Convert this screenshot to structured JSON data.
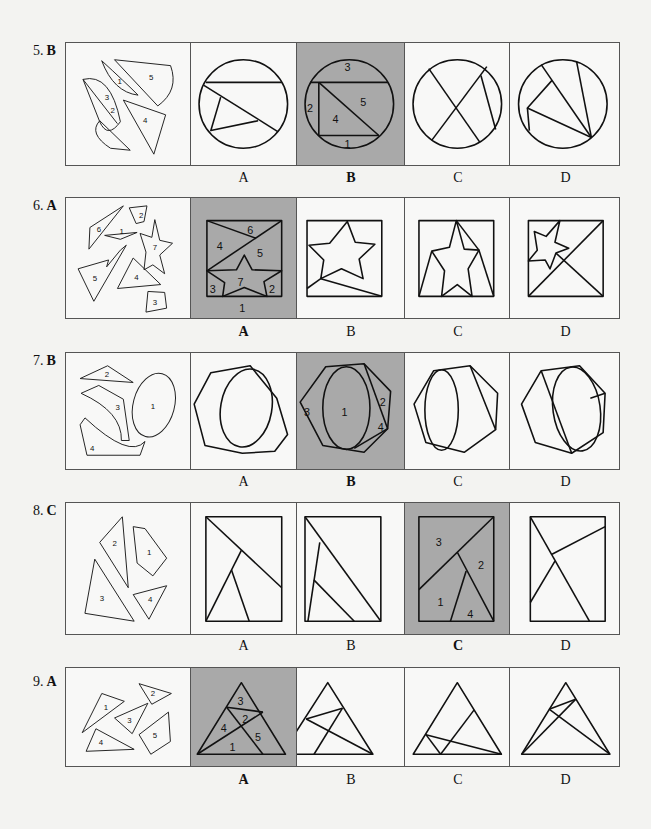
{
  "problems": [
    {
      "number": "5.",
      "answer": "B",
      "option_labels": [
        "A",
        "B",
        "C",
        "D"
      ],
      "correct_index": 1,
      "pieces_labels": [
        "1",
        "2",
        "3",
        "4",
        "5"
      ],
      "solution_labels": [
        "3",
        "2",
        "4",
        "5",
        "1"
      ],
      "shape": "circle"
    },
    {
      "number": "6.",
      "answer": "A",
      "option_labels": [
        "A",
        "B",
        "C",
        "D"
      ],
      "correct_index": 0,
      "pieces_labels": [
        "6",
        "2",
        "1",
        "7",
        "5",
        "4",
        "3"
      ],
      "solution_labels": [
        "6",
        "4",
        "5",
        "7",
        "3",
        "2",
        "1"
      ],
      "shape": "square-with-star"
    },
    {
      "number": "7.",
      "answer": "B",
      "option_labels": [
        "A",
        "B",
        "C",
        "D"
      ],
      "correct_index": 1,
      "pieces_labels": [
        "2",
        "3",
        "1",
        "4"
      ],
      "solution_labels": [
        "3",
        "1",
        "2",
        "4"
      ],
      "shape": "hexagon-with-ellipse"
    },
    {
      "number": "8.",
      "answer": "C",
      "option_labels": [
        "A",
        "B",
        "C",
        "D"
      ],
      "correct_index": 2,
      "pieces_labels": [
        "2",
        "1",
        "3",
        "4"
      ],
      "solution_labels": [
        "3",
        "2",
        "1",
        "4"
      ],
      "shape": "rectangle"
    },
    {
      "number": "9.",
      "answer": "A",
      "option_labels": [
        "A",
        "B",
        "C",
        "D"
      ],
      "correct_index": 0,
      "pieces_labels": [
        "1",
        "2",
        "3",
        "4",
        "5"
      ],
      "solution_labels": [
        "3",
        "2",
        "4",
        "5",
        "1"
      ],
      "shape": "triangle"
    }
  ],
  "colors": {
    "page_background": "#f3f3f1",
    "shaded_answer": "#a9a9a9",
    "line": "#111111"
  }
}
